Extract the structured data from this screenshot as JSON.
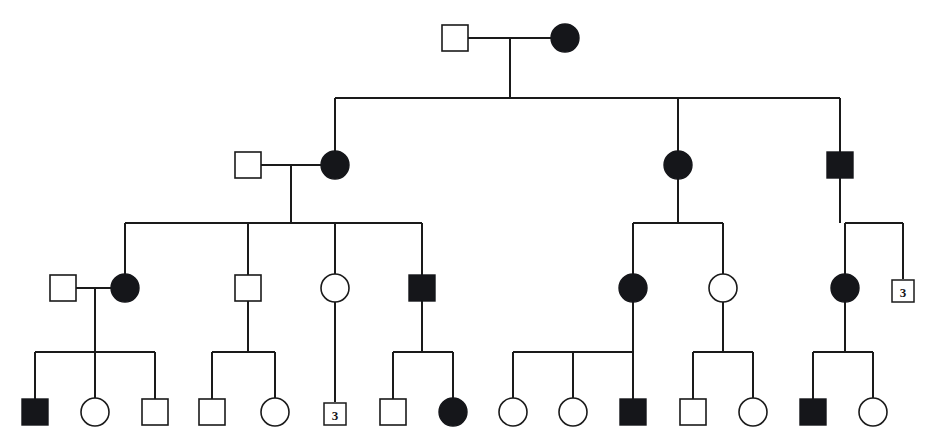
{
  "figure": {
    "kind": "family-pedigree",
    "width": 940,
    "height": 448,
    "background_color": "#ffffff",
    "line_color": "#1a1a1a",
    "affected_fill_color": "#15161a",
    "unaffected_fill_color": "#ffffff"
  },
  "legend_semantics": {
    "square": "male",
    "circle": "female",
    "filled": "affected",
    "open": "unaffected",
    "numbered_box": "sibship count of unaffected individuals"
  },
  "generations": [
    {
      "id": "I",
      "label": "I",
      "y": 38,
      "individuals": [
        {
          "id": "I-1",
          "shape": "square",
          "status": "unaffected",
          "sex": "male",
          "x": 455,
          "y": 38
        },
        {
          "id": "I-2",
          "shape": "circle",
          "status": "affected",
          "sex": "female",
          "x": 565,
          "y": 38
        }
      ]
    },
    {
      "id": "II",
      "label": "II",
      "y": 165,
      "individuals": [
        {
          "id": "II-1",
          "shape": "square",
          "status": "unaffected",
          "sex": "male",
          "x": 248,
          "y": 165
        },
        {
          "id": "II-2",
          "shape": "circle",
          "status": "affected",
          "sex": "female",
          "x": 335,
          "y": 165
        },
        {
          "id": "II-3",
          "shape": "circle",
          "status": "affected",
          "sex": "female",
          "x": 678,
          "y": 165
        },
        {
          "id": "II-4",
          "shape": "square",
          "status": "affected",
          "sex": "male",
          "x": 840,
          "y": 165
        }
      ]
    },
    {
      "id": "III",
      "label": "III",
      "y": 288,
      "individuals": [
        {
          "id": "III-1",
          "shape": "square",
          "status": "unaffected",
          "sex": "male",
          "x": 63,
          "y": 288
        },
        {
          "id": "III-2",
          "shape": "circle",
          "status": "affected",
          "sex": "female",
          "x": 125,
          "y": 288
        },
        {
          "id": "III-3",
          "shape": "square",
          "status": "unaffected",
          "sex": "male",
          "x": 248,
          "y": 288
        },
        {
          "id": "III-4",
          "shape": "circle",
          "status": "unaffected",
          "sex": "female",
          "x": 335,
          "y": 288
        },
        {
          "id": "III-5",
          "shape": "square",
          "status": "affected",
          "sex": "male",
          "x": 422,
          "y": 288
        },
        {
          "id": "III-6",
          "shape": "circle",
          "status": "affected",
          "sex": "female",
          "x": 633,
          "y": 288
        },
        {
          "id": "III-7",
          "shape": "circle",
          "status": "unaffected",
          "sex": "female",
          "x": 723,
          "y": 288
        },
        {
          "id": "III-8",
          "shape": "circle",
          "status": "affected",
          "sex": "female",
          "x": 845,
          "y": 288
        },
        {
          "id": "III-9",
          "shape": "count-box",
          "status": "unaffected",
          "sex": "unspecified",
          "x": 903,
          "y": 291,
          "count": "3"
        }
      ]
    },
    {
      "id": "IV",
      "label": "IV",
      "y": 412,
      "individuals": [
        {
          "id": "IV-1",
          "shape": "square",
          "status": "affected",
          "sex": "male",
          "x": 35,
          "y": 412
        },
        {
          "id": "IV-2",
          "shape": "circle",
          "status": "unaffected",
          "sex": "female",
          "x": 95,
          "y": 412
        },
        {
          "id": "IV-3",
          "shape": "square",
          "status": "unaffected",
          "sex": "male",
          "x": 155,
          "y": 412
        },
        {
          "id": "IV-4",
          "shape": "square",
          "status": "unaffected",
          "sex": "male",
          "x": 212,
          "y": 412
        },
        {
          "id": "IV-5",
          "shape": "circle",
          "status": "unaffected",
          "sex": "female",
          "x": 275,
          "y": 412
        },
        {
          "id": "IV-6",
          "shape": "count-box",
          "status": "unaffected",
          "sex": "unspecified",
          "x": 335,
          "y": 414,
          "count": "3"
        },
        {
          "id": "IV-7",
          "shape": "square",
          "status": "unaffected",
          "sex": "male",
          "x": 393,
          "y": 412
        },
        {
          "id": "IV-8",
          "shape": "circle",
          "status": "affected",
          "sex": "female",
          "x": 453,
          "y": 412
        },
        {
          "id": "IV-9",
          "shape": "circle",
          "status": "unaffected",
          "sex": "female",
          "x": 513,
          "y": 412
        },
        {
          "id": "IV-10",
          "shape": "circle",
          "status": "unaffected",
          "sex": "female",
          "x": 573,
          "y": 412
        },
        {
          "id": "IV-11",
          "shape": "square",
          "status": "affected",
          "sex": "male",
          "x": 633,
          "y": 412
        },
        {
          "id": "IV-12",
          "shape": "square",
          "status": "unaffected",
          "sex": "male",
          "x": 693,
          "y": 412
        },
        {
          "id": "IV-13",
          "shape": "circle",
          "status": "unaffected",
          "sex": "female",
          "x": 753,
          "y": 412
        },
        {
          "id": "IV-14",
          "shape": "square",
          "status": "affected",
          "sex": "male",
          "x": 813,
          "y": 412
        },
        {
          "id": "IV-15",
          "shape": "circle",
          "status": "unaffected",
          "sex": "female",
          "x": 873,
          "y": 412
        }
      ]
    }
  ],
  "matings": [
    {
      "id": "M-1",
      "left_x": 455,
      "right_x": 565,
      "y": 38,
      "descent_x": 510,
      "descent_to_y": 98
    },
    {
      "id": "M-2",
      "left_x": 248,
      "right_x": 335,
      "y": 165,
      "descent_x": 291,
      "descent_to_y": 223
    },
    {
      "id": "M-3",
      "left_x": 63,
      "right_x": 125,
      "y": 288,
      "descent_x": 95,
      "descent_to_y": 352
    }
  ],
  "vertical_drops": [
    {
      "id": "D-II-3",
      "x": 678,
      "from_y": 130,
      "to_y": 200
    },
    {
      "id": "D-II-4",
      "x": 840,
      "from_y": 130,
      "to_y": 200
    },
    {
      "id": "D-III-4",
      "x": 335,
      "from_y": 253,
      "to_y": 323
    },
    {
      "id": "D-III-5",
      "x": 422,
      "from_y": 253,
      "to_y": 323
    },
    {
      "id": "D-III-3",
      "x": 248,
      "from_y": 253,
      "to_y": 323
    },
    {
      "id": "D-III-2",
      "x": 125,
      "from_y": 253,
      "to_y": 288
    },
    {
      "id": "D-III-6",
      "x": 633,
      "from_y": 253,
      "to_y": 323
    },
    {
      "id": "D-III-7",
      "x": 723,
      "from_y": 253,
      "to_y": 323
    },
    {
      "id": "D-III-8",
      "x": 845,
      "from_y": 253,
      "to_y": 323
    },
    {
      "id": "D-III-9",
      "x": 903,
      "from_y": 253,
      "to_y": 279
    }
  ],
  "sibships": [
    {
      "id": "S-gen1",
      "bar_y": 98,
      "left_x": 335,
      "right_x": 840,
      "parent_descent_x": 510,
      "parent_descent_from_y": 38,
      "child_drops_x": [
        335,
        678,
        840
      ],
      "child_drop_to_y": 152
    },
    {
      "id": "S-genII-left",
      "bar_y": 223,
      "left_x": 125,
      "right_x": 422,
      "parent_descent_x": 291,
      "parent_descent_from_y": 165,
      "child_drops_x": [
        125,
        248,
        335,
        422
      ],
      "child_drop_to_y": 275
    },
    {
      "id": "S-genII-mid",
      "bar_y": 223,
      "left_x": 633,
      "right_x": 723,
      "parent_descent_x": 678,
      "parent_descent_from_y": 165,
      "child_drops_x": [
        633,
        723
      ],
      "child_drop_to_y": 275
    },
    {
      "id": "S-genII-right",
      "bar_y": 223,
      "left_x": 845,
      "right_x": 903,
      "parent_descent_x": 840,
      "parent_descent_from_y": 165,
      "child_drops_x": [
        845,
        903
      ],
      "child_drop_to_y": 275
    },
    {
      "id": "S-genIII-1",
      "bar_y": 352,
      "left_x": 35,
      "right_x": 155,
      "parent_descent_x": 95,
      "parent_descent_from_y": 288,
      "child_drops_x": [
        35,
        95,
        155
      ],
      "child_drop_to_y": 399
    },
    {
      "id": "S-genIII-2",
      "bar_y": 352,
      "left_x": 212,
      "right_x": 275,
      "parent_descent_x": 248,
      "parent_descent_from_y": 288,
      "child_drops_x": [
        212,
        275
      ],
      "child_drop_to_y": 399
    },
    {
      "id": "S-genIII-3",
      "bar_y": 352,
      "left_x": 335,
      "right_x": 335,
      "parent_descent_x": 335,
      "parent_descent_from_y": 288,
      "child_drops_x": [
        335
      ],
      "child_drop_to_y": 402
    },
    {
      "id": "S-genIII-4",
      "bar_y": 352,
      "left_x": 393,
      "right_x": 453,
      "parent_descent_x": 422,
      "parent_descent_from_y": 288,
      "child_drops_x": [
        393,
        453
      ],
      "child_drop_to_y": 399
    },
    {
      "id": "S-genIII-5",
      "bar_y": 352,
      "left_x": 513,
      "right_x": 633,
      "parent_descent_x": 633,
      "parent_descent_from_y": 288,
      "child_drops_x": [
        513,
        573,
        633
      ],
      "child_drop_to_y": 399
    },
    {
      "id": "S-genIII-6",
      "bar_y": 352,
      "left_x": 693,
      "right_x": 753,
      "parent_descent_x": 723,
      "parent_descent_from_y": 288,
      "child_drops_x": [
        693,
        753
      ],
      "child_drop_to_y": 399
    },
    {
      "id": "S-genIII-7",
      "bar_y": 352,
      "left_x": 813,
      "right_x": 873,
      "parent_descent_x": 845,
      "parent_descent_from_y": 288,
      "child_drops_x": [
        813,
        873
      ],
      "child_drop_to_y": 399
    }
  ],
  "sizes": {
    "square_side": 26,
    "circle_radius": 14,
    "count_box_side": 22
  },
  "counts": {
    "total_individuals": 30,
    "affected": 11,
    "unaffected": 17,
    "count_boxes": 2
  }
}
